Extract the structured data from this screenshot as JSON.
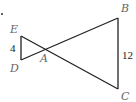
{
  "figure": {
    "type": "two triangles sharing vertex A (bowtie)",
    "points": {
      "E": {
        "label": "E",
        "x": 21,
        "y": 36
      },
      "D": {
        "label": "D",
        "x": 21,
        "y": 60
      },
      "A": {
        "label": "A",
        "x": 45,
        "y": 50
      },
      "B": {
        "label": "B",
        "x": 118,
        "y": 18
      },
      "C": {
        "label": "C",
        "x": 118,
        "y": 89
      }
    },
    "segments": [
      {
        "from": "E",
        "to": "D",
        "length_label": "4"
      },
      {
        "from": "B",
        "to": "C",
        "length_label": "12"
      },
      {
        "from": "E",
        "to": "C"
      },
      {
        "from": "D",
        "to": "B"
      }
    ],
    "bullet": "."
  }
}
